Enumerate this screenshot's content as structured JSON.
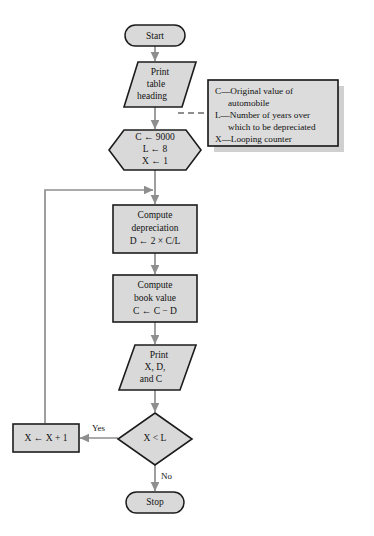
{
  "diagram": {
    "background_color": "#ffffff",
    "shape_fill_color": "#d9d9d9",
    "shape_border_color": "#1c1c1c",
    "connector_color": "#8e8e8e"
  },
  "nodes": {
    "start": {
      "type": "terminal",
      "label": "Start"
    },
    "print_heading": {
      "type": "input-output",
      "lines": [
        "Print",
        "table",
        "heading"
      ]
    },
    "initialize": {
      "type": "preparation",
      "lines": [
        "C ← 9000",
        "L ← 8",
        "X ← 1"
      ]
    },
    "compute_depreciation": {
      "type": "process",
      "lines": [
        "Compute",
        "depreciation",
        "D ← 2 × C/L"
      ]
    },
    "compute_book_value": {
      "type": "process",
      "lines": [
        "Compute",
        "book value",
        "C ← C − D"
      ]
    },
    "print_values": {
      "type": "input-output",
      "lines": [
        "Print",
        "X, D,",
        "and C"
      ]
    },
    "decision": {
      "type": "decision",
      "label": "X < L"
    },
    "increment": {
      "type": "process",
      "label": "X ← X + 1"
    },
    "stop": {
      "type": "terminal",
      "label": "Stop"
    }
  },
  "edge_labels": {
    "yes": "Yes",
    "no": "No"
  },
  "legend": {
    "entries": [
      {
        "lines": [
          "C—Original value of",
          "automobile"
        ]
      },
      {
        "lines": [
          "L—Number of years over",
          "which to be depreciated"
        ]
      },
      {
        "lines": [
          "X—Looping counter"
        ]
      }
    ],
    "flat_lines": [
      "C—Original value of",
      "automobile",
      "L—Number of years over",
      "which to be depreciated",
      "X—Looping counter"
    ]
  }
}
